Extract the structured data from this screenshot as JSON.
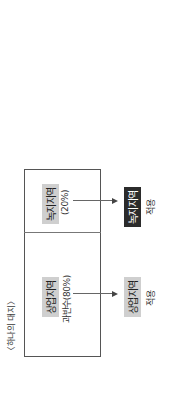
{
  "diagram": {
    "caption": "〈하나의 대지〉",
    "lot": {
      "left_cell": {
        "zone": "상업지역",
        "share": "과반수(80%)"
      },
      "right_cell": {
        "zone": "녹지지역",
        "share": "(20%)"
      }
    },
    "results": [
      {
        "zone": "상업지역",
        "label": "적용",
        "style": "light"
      },
      {
        "zone": "녹지지역",
        "label": "적용",
        "style": "dark"
      }
    ],
    "colors": {
      "highlight_light": "#cfcfcf",
      "highlight_dark": "#2b2b2b",
      "border": "#555555"
    }
  }
}
